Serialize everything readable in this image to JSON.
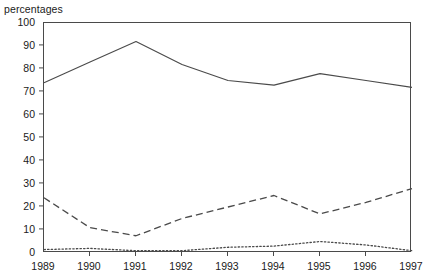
{
  "axis_unit_label": "percentages",
  "chart_data": {
    "type": "line",
    "title": "",
    "subtitle": "",
    "xlabel": "",
    "ylabel": "percentages",
    "categories": [
      "1989",
      "1990",
      "1991",
      "1992",
      "1993",
      "1994",
      "1995",
      "1996",
      "1997"
    ],
    "x": [
      1989,
      1990,
      1991,
      1992,
      1993,
      1994,
      1995,
      1996,
      1997
    ],
    "xlim": [
      1989,
      1997
    ],
    "ylim": [
      0,
      100
    ],
    "y_ticks": [
      0,
      10,
      20,
      30,
      40,
      50,
      60,
      70,
      80,
      90,
      100
    ],
    "y_tick_labels": [
      "0",
      "10",
      "20",
      "30",
      "40",
      "50",
      "60",
      "70",
      "80",
      "90",
      "100"
    ],
    "x_ticks": [
      1989,
      1990,
      1991,
      1992,
      1993,
      1994,
      1995,
      1996,
      1997
    ],
    "x_tick_labels": [
      "1989",
      "1990",
      "1991",
      "1992",
      "1993",
      "1994",
      "1995",
      "1996",
      "1997"
    ],
    "grid": false,
    "legend": null,
    "legend_position": "none",
    "annotations": [],
    "series": [
      {
        "name": "series-solid",
        "style": "solid",
        "color": "#4a4a4a",
        "values": [
          74,
          83,
          92,
          82,
          75,
          73,
          78,
          75,
          72
        ]
      },
      {
        "name": "series-dashed",
        "style": "dashed",
        "color": "#4a4a4a",
        "values": [
          24,
          11,
          7.5,
          15,
          20,
          25,
          17,
          22,
          28
        ]
      },
      {
        "name": "series-dotted",
        "style": "dotted",
        "color": "#4a4a4a",
        "values": [
          1.5,
          2,
          1,
          1,
          2.5,
          3,
          5,
          3.5,
          1
        ]
      }
    ]
  }
}
